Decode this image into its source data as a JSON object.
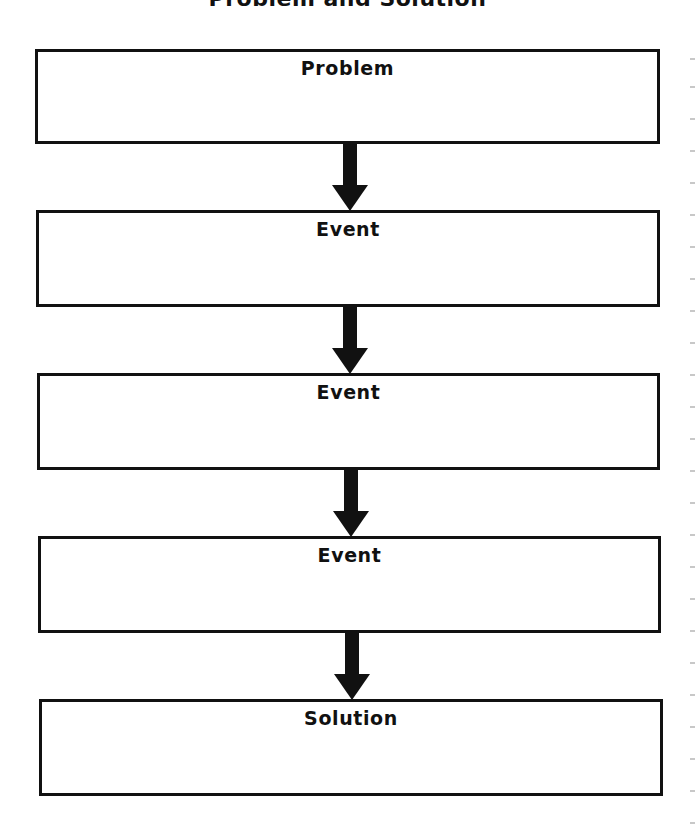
{
  "title": "Problem and Solution",
  "boxes": [
    {
      "label": "Problem",
      "content": ""
    },
    {
      "label": "Event",
      "content": ""
    },
    {
      "label": "Event",
      "content": ""
    },
    {
      "label": "Event",
      "content": ""
    },
    {
      "label": "Solution",
      "content": ""
    }
  ],
  "arrows": [
    {
      "from": "Problem",
      "to": "Event"
    },
    {
      "from": "Event",
      "to": "Event"
    },
    {
      "from": "Event",
      "to": "Event"
    },
    {
      "from": "Event",
      "to": "Solution"
    }
  ],
  "colors": {
    "border": "#111111",
    "arrow": "#111111",
    "background": "#ffffff"
  }
}
